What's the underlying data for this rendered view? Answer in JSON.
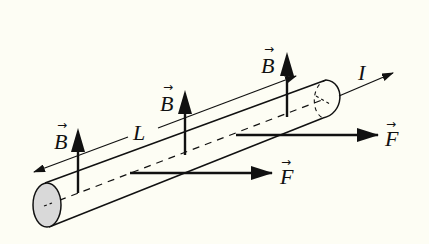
{
  "diagram": {
    "colors": {
      "background": "#fdfdf4",
      "stroke": "#111111",
      "cylinder_end_fill": "#d9d9d9"
    },
    "labels": {
      "current": "I",
      "length": "L",
      "field_1": "B",
      "field_2": "B",
      "field_3": "B",
      "force_1": "F",
      "force_2": "F",
      "vector_arrow": "→"
    },
    "elements": {
      "conductor": "cylindrical wire",
      "field_arrows": 3,
      "force_arrows": 2,
      "current_arrow": 1,
      "length_dimension": 1
    }
  }
}
